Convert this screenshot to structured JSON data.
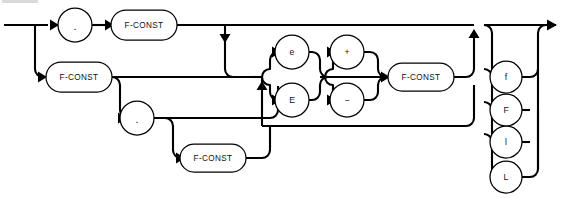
{
  "diagram": {
    "kind": "railroad-syntax-diagram",
    "background_color": "#ffffff",
    "line_color": "#000000",
    "node_fill": "#ffffff",
    "entry": {
      "name": "entry-rail",
      "label": ""
    },
    "exit": {
      "name": "exit-rail",
      "label": ""
    },
    "nodes": [
      {
        "id": "dot-top",
        "shape": "circle",
        "label": ".",
        "row": 1,
        "cx": 75,
        "cy": 25,
        "r": 17
      },
      {
        "id": "fconst-top",
        "shape": "stadium",
        "label": "F-CONST",
        "row": 1,
        "cx": 144,
        "cy": 25,
        "w": 66,
        "h": 30
      },
      {
        "id": "fconst-left",
        "shape": "stadium",
        "label": "F-CONST",
        "row": 2,
        "cx": 79,
        "cy": 77,
        "w": 66,
        "h": 30
      },
      {
        "id": "dot-mid",
        "shape": "circle",
        "label": ".",
        "row": 3,
        "cx": 137,
        "cy": 118,
        "r": 17
      },
      {
        "id": "fconst-frac",
        "shape": "stadium",
        "label": "F-CONST",
        "row": 4,
        "cx": 213,
        "cy": 158,
        "w": 66,
        "h": 28
      },
      {
        "id": "exp-e-lower",
        "shape": "circle",
        "label": "e",
        "row": 1,
        "cx": 292,
        "cy": 52,
        "r": 17
      },
      {
        "id": "exp-e-upper",
        "shape": "circle",
        "label": "E",
        "row": 3,
        "cx": 292,
        "cy": 100,
        "r": 17
      },
      {
        "id": "sign-plus",
        "shape": "circle",
        "label": "+",
        "row": 1,
        "cx": 347,
        "cy": 52,
        "r": 17
      },
      {
        "id": "sign-minus",
        "shape": "circle",
        "label": "−",
        "row": 3,
        "cx": 347,
        "cy": 100,
        "r": 17
      },
      {
        "id": "fconst-exp",
        "shape": "stadium",
        "label": "F-CONST",
        "row": 2,
        "cx": 421,
        "cy": 77,
        "w": 66,
        "h": 28
      },
      {
        "id": "suffix-f-lower",
        "shape": "circle",
        "label": "f",
        "row": 1,
        "cx": 506,
        "cy": 77,
        "r": 16
      },
      {
        "id": "suffix-f-upper",
        "shape": "circle",
        "label": "F",
        "row": 2,
        "cx": 506,
        "cy": 110,
        "r": 16
      },
      {
        "id": "suffix-l-lower",
        "shape": "circle",
        "label": "l",
        "row": 3,
        "cx": 506,
        "cy": 142,
        "r": 16
      },
      {
        "id": "suffix-l-upper",
        "shape": "circle",
        "label": "L",
        "row": 4,
        "cx": 506,
        "cy": 177,
        "r": 16
      }
    ],
    "groups": {
      "mantissa_forms": [
        ".  F-CONST",
        "F-CONST",
        "F-CONST . F-CONST",
        "F-CONST ."
      ],
      "exponent_marker": [
        "e",
        "E"
      ],
      "exponent_sign": [
        "+",
        "−"
      ],
      "exponent_digits": "F-CONST",
      "suffixes": [
        "f",
        "F",
        "l",
        "L"
      ]
    }
  }
}
